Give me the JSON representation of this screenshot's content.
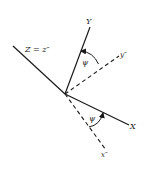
{
  "diagram": {
    "type": "coordinate-rotation",
    "colors": {
      "line": "#1a1a1a",
      "background": "#ffffff"
    },
    "origin": {
      "x": 65,
      "y": 94
    },
    "axes": [
      {
        "id": "Z",
        "label": "Z = z″",
        "style": "solid",
        "end": {
          "x": 13,
          "y": 46
        }
      },
      {
        "id": "Y",
        "label": "Y",
        "style": "solid",
        "end": {
          "x": 90,
          "y": 27
        }
      },
      {
        "id": "y2",
        "label": "y″",
        "style": "dashed",
        "end": {
          "x": 119,
          "y": 56
        }
      },
      {
        "id": "X",
        "label": "X",
        "style": "solid",
        "end": {
          "x": 129,
          "y": 125
        }
      },
      {
        "id": "x2",
        "label": "x″",
        "style": "dashed",
        "end": {
          "x": 106,
          "y": 150
        }
      }
    ],
    "angles": [
      {
        "id": "psi-upper",
        "label": "ψ",
        "between": [
          "y″",
          "Y"
        ]
      },
      {
        "id": "psi-lower",
        "label": "ψ",
        "between": [
          "x″",
          "X"
        ]
      }
    ]
  },
  "labels": {
    "z_axis": "Z = z″",
    "y_axis": "Y",
    "y_double_prime": "y″",
    "x_axis": "X",
    "x_double_prime": "x″",
    "psi_upper": "ψ",
    "psi_lower": "ψ"
  }
}
